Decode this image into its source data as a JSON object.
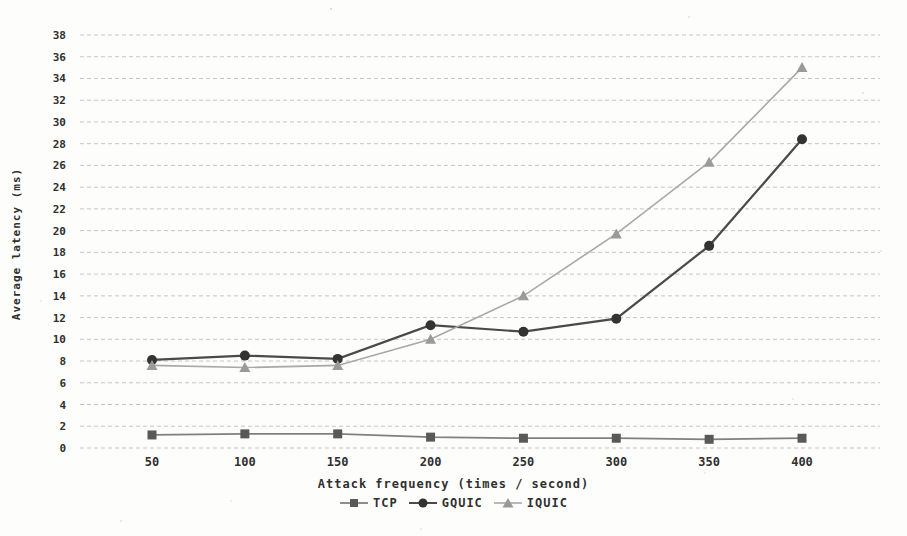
{
  "chart_data": {
    "type": "line",
    "title": "",
    "xlabel": "Attack frequency (times / second)",
    "ylabel": "Average latency (ms)",
    "x": [
      50,
      100,
      150,
      200,
      250,
      300,
      350,
      400
    ],
    "xticks": [
      "50",
      "100",
      "150",
      "200",
      "250",
      "300",
      "350",
      "400"
    ],
    "yticks": [
      0,
      2,
      4,
      6,
      8,
      10,
      12,
      14,
      16,
      18,
      20,
      22,
      24,
      26,
      28,
      30,
      32,
      34,
      36,
      38
    ],
    "ylim": [
      0,
      38
    ],
    "ytick_step": 2,
    "grid": "horizontal-dashed",
    "legend_position": "bottom",
    "series": [
      {
        "name": "TCP",
        "marker": "square",
        "color": "#808080",
        "marker_color": "#595959",
        "line_width": 1.8,
        "values": [
          1.2,
          1.3,
          1.3,
          1.0,
          0.9,
          0.9,
          0.8,
          0.9
        ]
      },
      {
        "name": "GQUIC",
        "marker": "circle",
        "color": "#4a4a4a",
        "marker_color": "#333333",
        "line_width": 2.2,
        "values": [
          8.1,
          8.5,
          8.2,
          11.3,
          10.7,
          11.9,
          18.6,
          28.4
        ]
      },
      {
        "name": "IQUIC",
        "marker": "triangle",
        "color": "#a8a8a8",
        "marker_color": "#9a9a9a",
        "line_width": 1.6,
        "values": [
          7.6,
          7.4,
          7.6,
          10.0,
          14.0,
          19.7,
          26.3,
          35.0
        ]
      }
    ],
    "colors": {
      "grid": "#c6c6c6",
      "tick_text": "#2f2f2f",
      "background": "#fdfdfc"
    }
  }
}
